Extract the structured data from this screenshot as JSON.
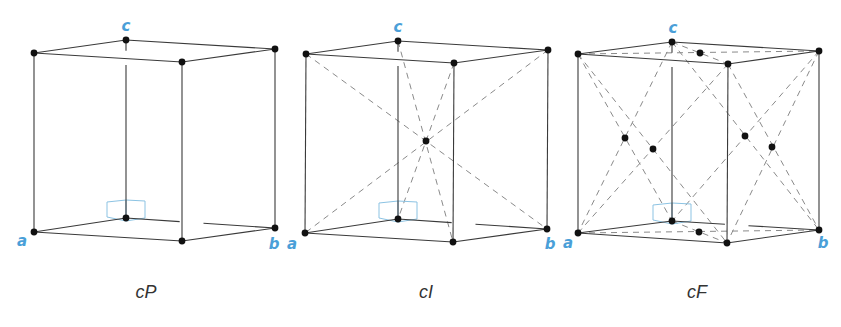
{
  "colors": {
    "edge": "#3a3a3a",
    "dash": "#8a8a8a",
    "atom": "#111111",
    "axis_label": "#4a9fd8",
    "marker": "#8cc3e3",
    "caption": "#333333"
  },
  "lattices": [
    {
      "id": "cP",
      "caption": "cP",
      "caption_pos": [
        146,
        292
      ],
      "axis_labels": {
        "a": "a",
        "b": "b",
        "c": "c"
      },
      "axis_label_pos": {
        "a": [
          22,
          241
        ],
        "b": [
          274,
          244
        ],
        "c": [
          126,
          26
        ]
      },
      "vertices": {
        "TB": [
          126,
          40
        ],
        "TFL": [
          34,
          53
        ],
        "TFR": [
          182,
          62
        ],
        "TBR": [
          275,
          49
        ],
        "BB": [
          126,
          218
        ],
        "BFL": [
          34,
          232
        ],
        "BFR": [
          182,
          241
        ],
        "BBR": [
          275,
          228
        ]
      },
      "extra_atoms": []
    },
    {
      "id": "cI",
      "caption": "cI",
      "caption_pos": [
        426,
        292
      ],
      "axis_labels": {
        "a": "a",
        "b": "b",
        "c": "c"
      },
      "axis_label_pos": {
        "a": [
          292,
          244
        ],
        "b": [
          550,
          244
        ],
        "c": [
          398,
          27
        ]
      },
      "vertices": {
        "TB": [
          398,
          41
        ],
        "TFL": [
          306,
          54
        ],
        "TFR": [
          454,
          63
        ],
        "TBR": [
          548,
          50
        ],
        "BB": [
          398,
          219
        ],
        "BFL": [
          305,
          233
        ],
        "BFR": [
          453,
          242
        ],
        "BBR": [
          547,
          229
        ]
      },
      "extra_atoms": [
        [
          426,
          141
        ]
      ]
    },
    {
      "id": "cF",
      "caption": "cF",
      "caption_pos": [
        697,
        292
      ],
      "axis_labels": {
        "a": "a",
        "b": "b",
        "c": "c"
      },
      "axis_label_pos": {
        "a": [
          568,
          243
        ],
        "b": [
          823,
          243
        ],
        "c": [
          673,
          28
        ]
      },
      "vertices": {
        "TB": [
          672,
          42
        ],
        "TFL": [
          578,
          54
        ],
        "TFR": [
          728,
          64
        ],
        "TBR": [
          819,
          51
        ],
        "BB": [
          672,
          221
        ],
        "BFL": [
          578,
          233
        ],
        "BFR": [
          727,
          243
        ],
        "BBR": [
          819,
          230
        ]
      },
      "extra_atoms": [
        [
          700,
          53
        ],
        [
          699,
          232
        ],
        [
          625,
          138
        ],
        [
          653,
          149
        ],
        [
          745,
          136
        ],
        [
          772,
          147
        ]
      ]
    }
  ]
}
